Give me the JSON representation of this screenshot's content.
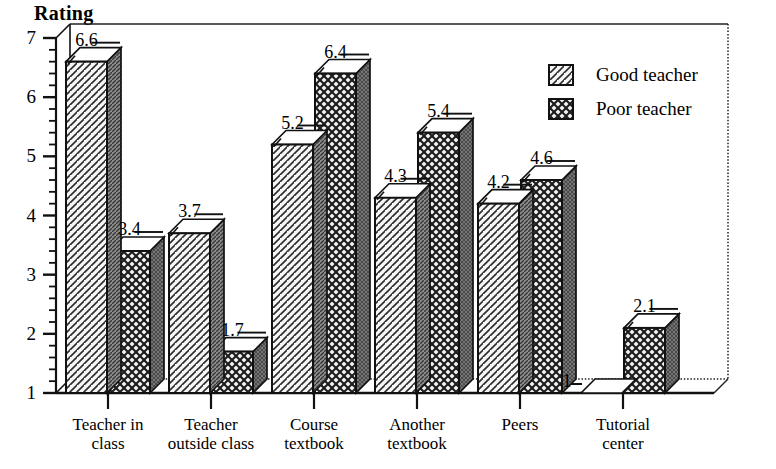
{
  "chart_data": {
    "type": "bar",
    "title": "",
    "ylabel": "Rating",
    "xlabel": "",
    "ylim": [
      1,
      7
    ],
    "yticks": [
      1,
      2,
      3,
      4,
      5,
      6,
      7
    ],
    "minor_tick_step": 0.2,
    "grid": false,
    "legend_position": "top-right",
    "style": "3d-bar-scanned",
    "categories": [
      "Teacher in\nclass",
      "Teacher\noutside class",
      "Course\ntextbook",
      "Another\ntextbook",
      "Peers",
      "Tutorial\ncenter"
    ],
    "series": [
      {
        "name": "Good teacher",
        "pattern": "diagonal-hatch",
        "values": [
          6.6,
          3.7,
          5.2,
          4.3,
          4.2,
          1
        ],
        "labels": [
          "6.6",
          "3.7",
          "5.2",
          "4.3",
          "4.2",
          "1"
        ]
      },
      {
        "name": "Poor teacher",
        "pattern": "cross-hatch",
        "values": [
          3.4,
          1.7,
          6.4,
          5.4,
          4.6,
          2.1
        ],
        "labels": [
          "3.4",
          "1.7",
          "6.4",
          "5.4",
          "4.6",
          "2.1"
        ]
      }
    ]
  },
  "legend": {
    "items": [
      {
        "label": "Good teacher"
      },
      {
        "label": "Poor teacher"
      }
    ]
  },
  "colors": {
    "ink": "#111111",
    "good_fill": "#f4f4f4",
    "poor_fill": "#ededed",
    "side_dark": "#6e6e6e",
    "paper": "#ffffff"
  }
}
